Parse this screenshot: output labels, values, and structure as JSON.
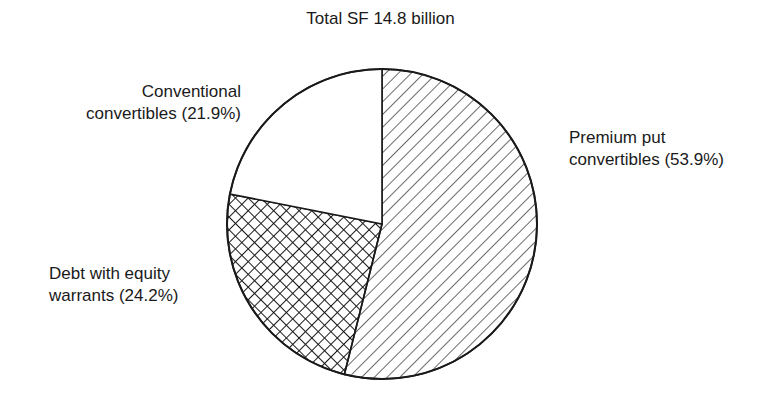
{
  "chart_data": {
    "type": "pie",
    "title": "Total SF 14.8 billion",
    "start_angle_deg": 0,
    "direction": "clockwise",
    "slices": [
      {
        "label": "Premium put convertibles",
        "value": 53.9,
        "pattern": "diagonal-hatch"
      },
      {
        "label": "Debt with equity warrants",
        "value": 24.2,
        "pattern": "cross-hatch"
      },
      {
        "label": "Conventional convertibles",
        "value": 21.9,
        "pattern": "none"
      }
    ]
  },
  "labels": {
    "premium": {
      "line1": "Premium put",
      "line2": "convertibles (53.9%)"
    },
    "debt": {
      "line1": "Debt with equity",
      "line2": "warrants (24.2%)"
    },
    "conventional": {
      "line1": "Conventional",
      "line2": "convertibles (21.9%)"
    }
  },
  "colors": {
    "ink": "#1a1a1a",
    "background": "#ffffff"
  }
}
